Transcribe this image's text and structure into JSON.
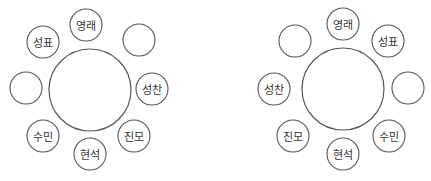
{
  "colors": {
    "stroke": "#555555",
    "text": "#333333",
    "background": "#ffffff"
  },
  "diagrams": [
    {
      "name": "left-arrangement",
      "table": {
        "cx": 90,
        "cy": 90,
        "r": 41
      },
      "seats": [
        {
          "cx": 86,
          "cy": 25,
          "label": "영래"
        },
        {
          "cx": 139,
          "cy": 40,
          "label": ""
        },
        {
          "cx": 152,
          "cy": 89,
          "label": "성찬"
        },
        {
          "cx": 134,
          "cy": 136,
          "label": "진모"
        },
        {
          "cx": 90,
          "cy": 154,
          "label": "현석"
        },
        {
          "cx": 43,
          "cy": 136,
          "label": "수민"
        },
        {
          "cx": 26,
          "cy": 88,
          "label": ""
        },
        {
          "cx": 43,
          "cy": 42,
          "label": "성표"
        }
      ]
    },
    {
      "name": "right-arrangement",
      "table": {
        "cx": 343,
        "cy": 89,
        "r": 41
      },
      "seats": [
        {
          "cx": 343,
          "cy": 24,
          "label": "영래"
        },
        {
          "cx": 388,
          "cy": 41,
          "label": "성표"
        },
        {
          "cx": 408,
          "cy": 88,
          "label": ""
        },
        {
          "cx": 389,
          "cy": 136,
          "label": "수민"
        },
        {
          "cx": 343,
          "cy": 154,
          "label": "현석"
        },
        {
          "cx": 293,
          "cy": 136,
          "label": "진모"
        },
        {
          "cx": 274,
          "cy": 89,
          "label": "성찬"
        },
        {
          "cx": 295,
          "cy": 41,
          "label": ""
        }
      ]
    }
  ],
  "seat_radius": 16
}
